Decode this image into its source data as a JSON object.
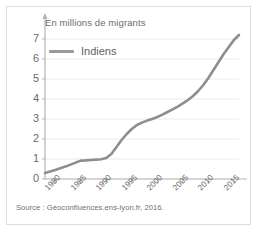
{
  "figure": {
    "axis_title": "En millions de migrants",
    "source": "Source : Géoconfluences.ens-lyon.fr, 2016."
  },
  "legend": {
    "entries": [
      {
        "label": "Indiens",
        "color": "#9a9a9a"
      }
    ]
  },
  "colors": {
    "line": "#8e8e8e",
    "grid": "#ececec",
    "axis": "#b5b5b5",
    "text": "#6a6a6a",
    "border": "#dedede",
    "background": "#ffffff"
  },
  "chart_data": {
    "type": "line",
    "title": "En millions de migrants",
    "xlabel": "",
    "ylabel": "En millions de migrants",
    "xlim": [
      1978,
      2016
    ],
    "ylim": [
      0,
      7.5
    ],
    "yticks": [
      0,
      1,
      2,
      3,
      4,
      5,
      6,
      7
    ],
    "ytick_labels": [
      "0",
      "1",
      "2",
      "3",
      "4",
      "5",
      "6",
      "7"
    ],
    "xticks": [
      1980,
      1985,
      1990,
      1995,
      2000,
      2005,
      2010,
      2015
    ],
    "xtick_labels": [
      "1980",
      "1985",
      "1990",
      "1995",
      "2000",
      "2005",
      "2010",
      "2015"
    ],
    "grid": "horizontal",
    "legend_position": "upper-left",
    "series": [
      {
        "name": "Indiens",
        "color": "#8e8e8e",
        "x": [
          1978,
          1980,
          1982,
          1984,
          1985,
          1986,
          1987,
          1988,
          1989,
          1990,
          1991,
          1992,
          1993,
          1994,
          1995,
          1996,
          1997,
          1998,
          1999,
          2000,
          2001,
          2002,
          2003,
          2004,
          2005,
          2006,
          2007,
          2008,
          2009,
          2010,
          2011,
          2012,
          2013,
          2014,
          2015,
          2016
        ],
        "y": [
          0.3,
          0.45,
          0.62,
          0.82,
          0.92,
          0.93,
          0.95,
          0.97,
          0.99,
          1.05,
          1.25,
          1.6,
          1.95,
          2.25,
          2.5,
          2.7,
          2.82,
          2.92,
          3.0,
          3.1,
          3.22,
          3.35,
          3.48,
          3.62,
          3.78,
          3.95,
          4.15,
          4.4,
          4.7,
          5.05,
          5.45,
          5.85,
          6.25,
          6.6,
          6.95,
          7.2
        ]
      }
    ]
  }
}
